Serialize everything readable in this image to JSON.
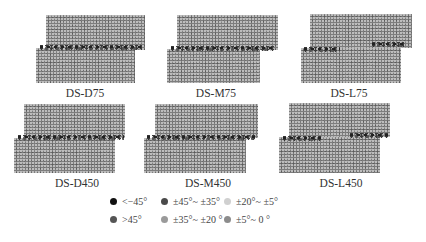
{
  "panels": [
    {
      "id": "DS-D75",
      "label": "DS-D75"
    },
    {
      "id": "DS-M75",
      "label": "DS-M75"
    },
    {
      "id": "DS-L75",
      "label": "DS-L75"
    },
    {
      "id": "DS-D450",
      "label": "DS-D450"
    },
    {
      "id": "DS-M450",
      "label": "DS-M450"
    },
    {
      "id": "DS-L450",
      "label": "DS-L450"
    }
  ],
  "legend": [
    {
      "label": "<−45°",
      "color": "#111111"
    },
    {
      "label": "±45°~ ±35°",
      "color": "#4a4a4a"
    },
    {
      "label": "±20°~ ±5°",
      "color": "#d0d0d0"
    },
    {
      "label": ">45°",
      "color": "#555555"
    },
    {
      "label": "±35°~ ±20 °",
      "color": "#9a9a9a"
    },
    {
      "label": "±5°~ 0 °",
      "color": "#8c8c8c"
    }
  ]
}
